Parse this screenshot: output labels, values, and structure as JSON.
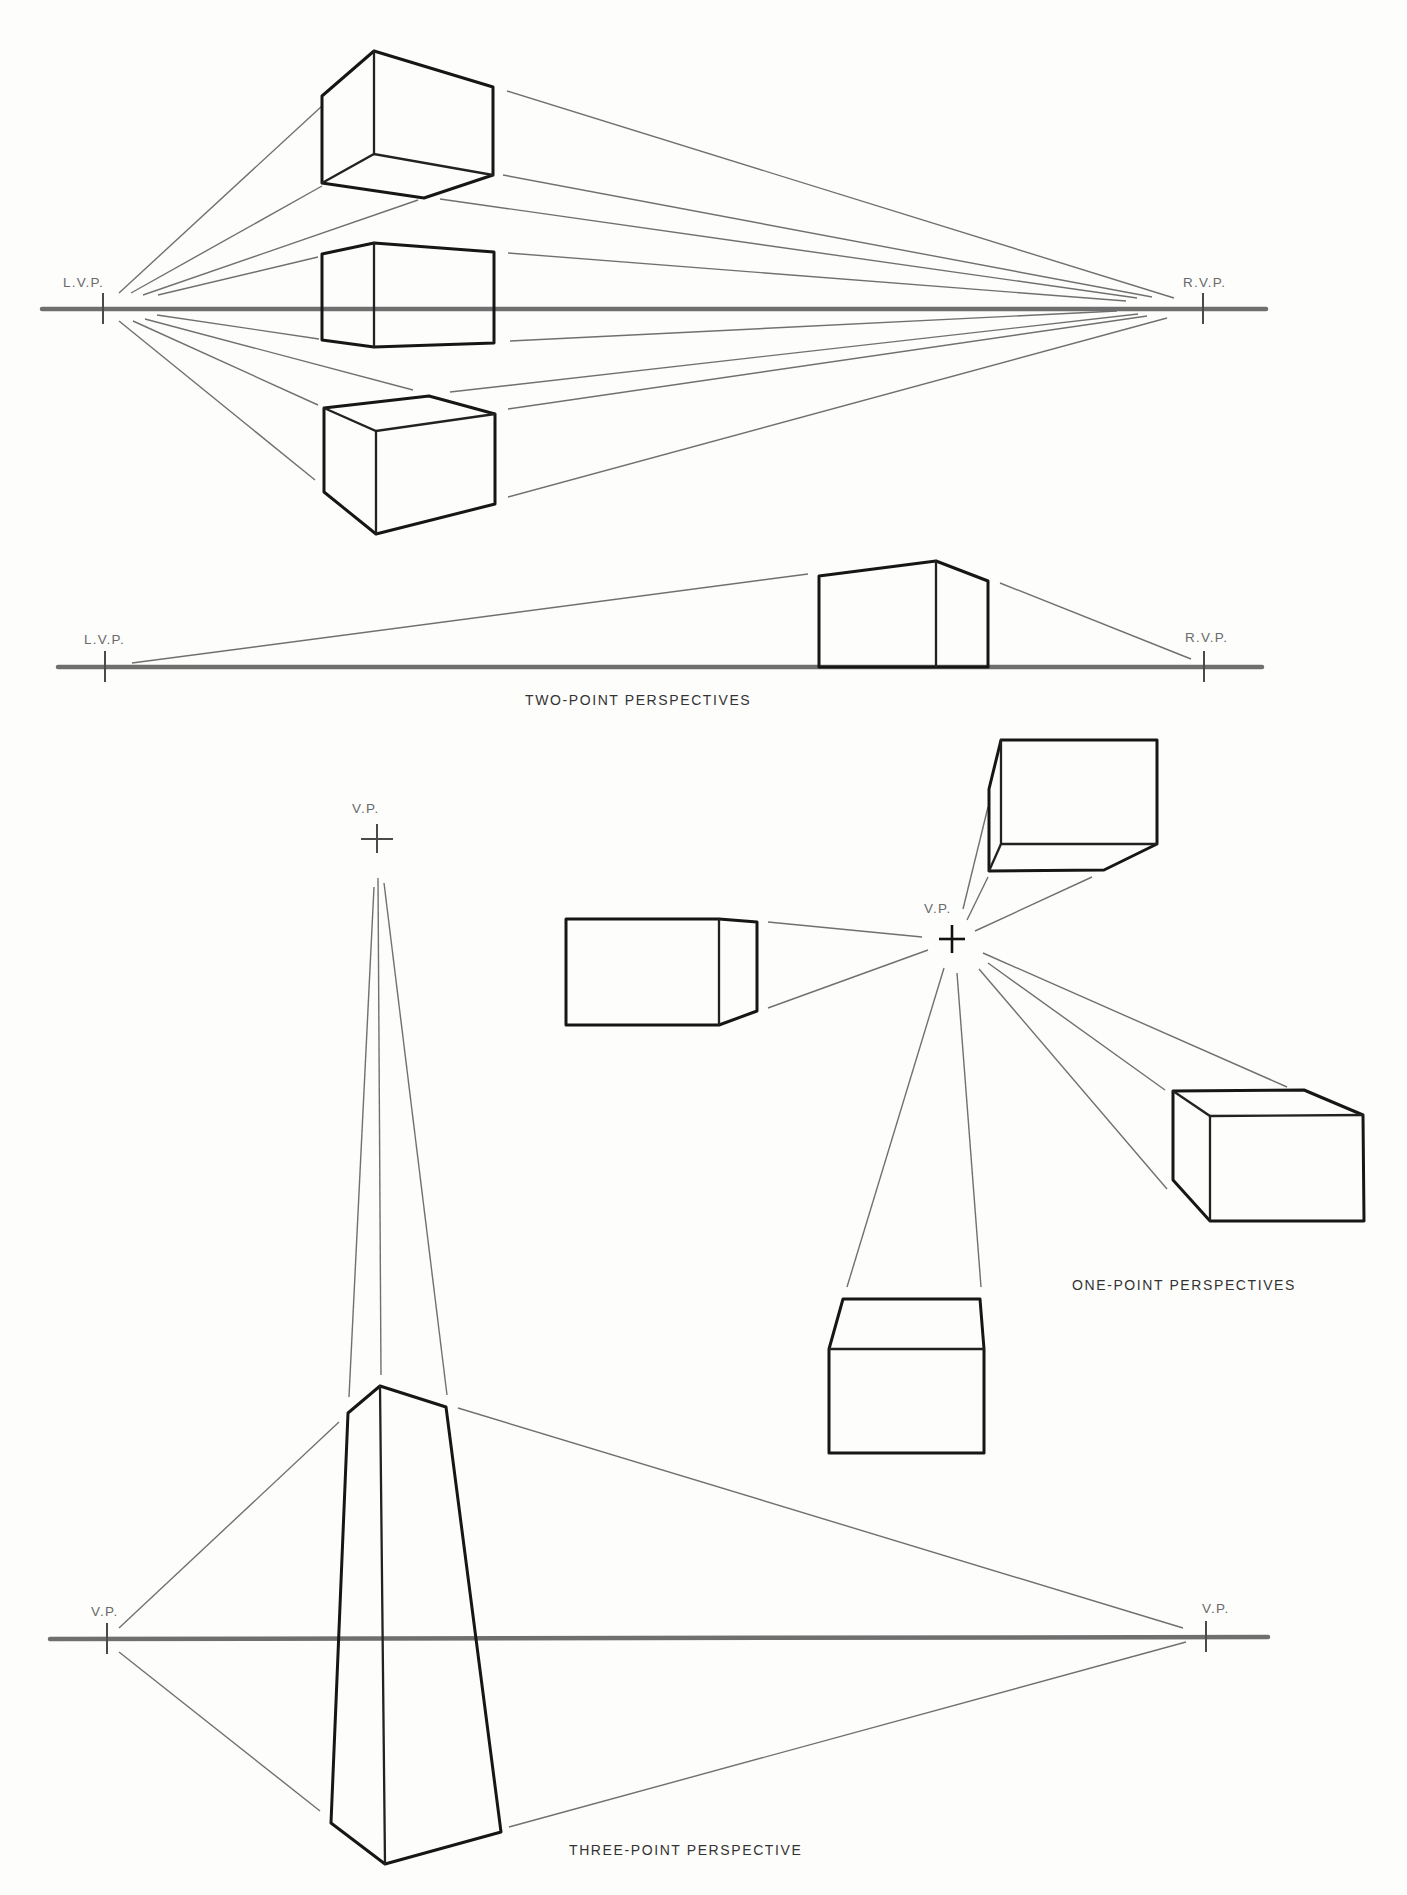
{
  "captions": {
    "two_point": "TWO-POINT PERSPECTIVES",
    "one_point": "ONE-POINT PERSPECTIVES",
    "three_point": "THREE-POINT PERSPECTIVE"
  },
  "labels": {
    "lvp_1": "L.V.P.",
    "rvp_1": "R.V.P.",
    "lvp_2": "L.V.P.",
    "rvp_2": "R.V.P.",
    "vp_one_point": "V.P.",
    "vp_three_top": "V.P.",
    "vp_three_left": "V.P.",
    "vp_three_right": "V.P."
  },
  "colors": {
    "background": "#fdfdfb",
    "ink": "#161616",
    "guide": "#707070",
    "horizon": "#6f6f6f"
  },
  "geometry": {
    "horizons": [
      {
        "id": "two-point-horizon-1",
        "x1": 42,
        "y1": 309,
        "x2": 1266,
        "y2": 309
      },
      {
        "id": "two-point-horizon-2",
        "x1": 58,
        "y1": 667,
        "x2": 1262,
        "y2": 667
      },
      {
        "id": "three-point-horizon",
        "x1": 50,
        "y1": 1639,
        "x2": 1268,
        "y2": 1637
      }
    ],
    "vanishing_points": [
      {
        "id": "lvp-1",
        "x": 103,
        "y": 309,
        "type": "tick",
        "label_key": "lvp_1",
        "lx": 63,
        "ly": 287
      },
      {
        "id": "rvp-1",
        "x": 1203,
        "y": 309,
        "type": "tick",
        "label_key": "rvp_1",
        "lx": 1183,
        "ly": 287
      },
      {
        "id": "lvp-2",
        "x": 105,
        "y": 667,
        "type": "tick",
        "label_key": "lvp_2",
        "lx": 84,
        "ly": 644
      },
      {
        "id": "rvp-2",
        "x": 1204,
        "y": 667,
        "type": "tick",
        "label_key": "rvp_2",
        "lx": 1185,
        "ly": 642
      },
      {
        "id": "vp-one-point",
        "x": 952,
        "y": 939,
        "type": "cross-bold",
        "label_key": "vp_one_point",
        "lx": 924,
        "ly": 913
      },
      {
        "id": "vp-three-top",
        "x": 377,
        "y": 839,
        "type": "cross",
        "label_key": "vp_three_top",
        "lx": 352,
        "ly": 813
      },
      {
        "id": "vp-three-left",
        "x": 107,
        "y": 1639,
        "type": "tick",
        "label_key": "vp_three_left",
        "lx": 91,
        "ly": 1616
      },
      {
        "id": "vp-three-right",
        "x": 1206,
        "y": 1637,
        "type": "tick",
        "label_key": "vp_three_right",
        "lx": 1202,
        "ly": 1613
      }
    ],
    "guides": [
      [
        119,
        293,
        322,
        106
      ],
      [
        131,
        293,
        322,
        186
      ],
      [
        143,
        295,
        418,
        200
      ],
      [
        158,
        295,
        318,
        257
      ],
      [
        157,
        315,
        319,
        339
      ],
      [
        145,
        319,
        413,
        390
      ],
      [
        133,
        321,
        318,
        405
      ],
      [
        119,
        321,
        315,
        480
      ],
      [
        507,
        91,
        1174,
        298
      ],
      [
        503,
        175,
        1152,
        297
      ],
      [
        440,
        199,
        1137,
        298
      ],
      [
        508,
        253,
        1126,
        301
      ],
      [
        510,
        341,
        1117,
        311
      ],
      [
        450,
        392,
        1138,
        314
      ],
      [
        508,
        409,
        1147,
        316
      ],
      [
        508,
        497,
        1167,
        318
      ],
      [
        132,
        663,
        808,
        574
      ],
      [
        1000,
        583,
        1191,
        659
      ],
      [
        768,
        922,
        922,
        937
      ],
      [
        768,
        1008,
        928,
        950
      ],
      [
        963,
        909,
        988,
        807
      ],
      [
        967,
        920,
        988,
        877
      ],
      [
        975,
        931,
        1092,
        877
      ],
      [
        983,
        953,
        1287,
        1087
      ],
      [
        988,
        963,
        1165,
        1090
      ],
      [
        979,
        969,
        1167,
        1189
      ],
      [
        944,
        968,
        847,
        1287
      ],
      [
        957,
        973,
        981,
        1287
      ],
      [
        374,
        887,
        349,
        1397
      ],
      [
        378,
        878,
        381,
        1375
      ],
      [
        384,
        883,
        447,
        1395
      ],
      [
        119,
        1628,
        339,
        1422
      ],
      [
        119,
        1652,
        320,
        1811
      ],
      [
        458,
        1408,
        1183,
        1628
      ],
      [
        509,
        1827,
        1186,
        1642
      ]
    ],
    "solids": [
      {
        "id": "two-point-box-above",
        "paths": [
          "M322,96 L374,51 L493,87 L493,175 L424,198 L322,183 Z",
          "M374,51 L374,154",
          "M322,183 L374,154 L493,175"
        ]
      },
      {
        "id": "two-point-box-on-horizon",
        "paths": [
          "M322,254 L374,243 L494,252 L494,343 L374,347 L322,340 Z",
          "M374,243 L374,347"
        ]
      },
      {
        "id": "two-point-box-below",
        "paths": [
          "M324,408 L429,396 L495,414 L495,504 L376,534 L324,492 Z",
          "M324,408 L376,431 L495,414",
          "M376,431 L376,534"
        ]
      },
      {
        "id": "two-point-box-small",
        "paths": [
          "M819,576 L936,561 L988,581 L988,667 L819,667 Z",
          "M936,561 L936,667"
        ]
      },
      {
        "id": "one-point-box-left",
        "paths": [
          "M566,919 L719,919 L757,922 L757,1011 L719,1025 L566,1025 Z",
          "M719,919 L719,1025"
        ]
      },
      {
        "id": "one-point-box-top-right",
        "paths": [
          "M1001,740 L1157,740 L1157,844 L1104,870 L989,871 L989,789 Z",
          "M1001,740 L1001,844 L1157,844",
          "M1001,844 L989,871"
        ]
      },
      {
        "id": "one-point-box-bottom-right",
        "paths": [
          "M1173,1091 L1304,1090 L1363,1115 L1364,1221 L1210,1221 L1173,1180 Z",
          "M1173,1091 L1210,1116 L1363,1115",
          "M1210,1116 L1210,1221"
        ]
      },
      {
        "id": "one-point-box-bottom",
        "paths": [
          "M843,1299 L980,1299 L984,1349 L984,1453 L829,1453 L829,1349 Z",
          "M829,1349 L984,1349"
        ]
      },
      {
        "id": "three-point-tower",
        "paths": [
          "M348,1413 L380,1386 L446,1407 L501,1832 L385,1864 L331,1823 Z",
          "M380,1386 L385,1864"
        ]
      }
    ],
    "caption_positions": {
      "two_point": {
        "x": 525,
        "y": 705
      },
      "one_point": {
        "x": 1072,
        "y": 1290
      },
      "three_point": {
        "x": 569,
        "y": 1855
      }
    }
  }
}
